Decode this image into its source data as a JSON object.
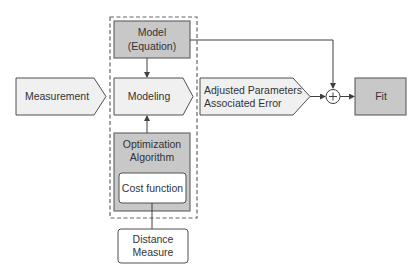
{
  "diagram": {
    "nodes": {
      "measurement": {
        "label": "Measurement"
      },
      "model": {
        "line1": "Model",
        "line2": "(Equation)"
      },
      "modeling": {
        "label": "Modeling"
      },
      "adjusted": {
        "line1": "Adjusted Parameters",
        "line2": "Associated Error"
      },
      "sum": {
        "symbol": "+"
      },
      "fit": {
        "label": "Fit"
      },
      "optimization": {
        "line1": "Optimization",
        "line2": "Algorithm"
      },
      "cost": {
        "label": "Cost function"
      },
      "distance": {
        "line1": "Distance",
        "line2": "Measure"
      }
    },
    "edges": [
      {
        "from": "model",
        "to": "modeling"
      },
      {
        "from": "optimization",
        "to": "modeling"
      },
      {
        "from": "distance",
        "to": "cost"
      },
      {
        "from": "measurement",
        "to": "modeling"
      },
      {
        "from": "modeling",
        "to": "adjusted"
      },
      {
        "from": "adjusted",
        "to": "sum"
      },
      {
        "from": "model",
        "to": "sum"
      },
      {
        "from": "sum",
        "to": "fit"
      }
    ],
    "colors": {
      "dark_fill": "#c8c8c8",
      "light_fill": "#f0f0f0",
      "white_fill": "#ffffff",
      "stroke": "#505050"
    }
  }
}
